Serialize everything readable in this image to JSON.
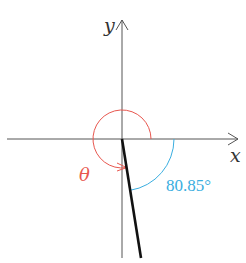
{
  "diagram": {
    "axes": {
      "x_label": "x",
      "y_label": "y",
      "color": "#555555"
    },
    "terminal_side": {
      "color": "#111111",
      "description": "line from origin into fourth quadrant, 80.85° below positive x-axis"
    },
    "theta_arc": {
      "label": "θ",
      "color": "#e8574f"
    },
    "reference_angle": {
      "label": "80.85°",
      "value_degrees": 80.85,
      "color": "#3aaee0"
    }
  }
}
